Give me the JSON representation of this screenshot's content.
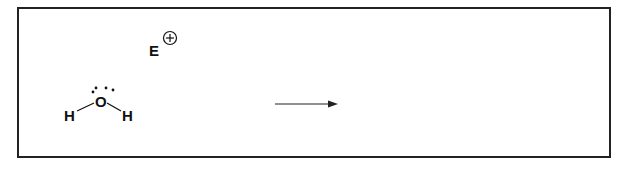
{
  "diagram": {
    "type": "reaction-scheme",
    "reactants": {
      "electrophile": {
        "symbol": "E",
        "charge": "+"
      },
      "water": {
        "central_atom": "O",
        "lone_pair_dots": 4,
        "substituents": [
          "H",
          "H"
        ]
      }
    },
    "arrow": {
      "direction": "right",
      "label": ""
    },
    "products": []
  },
  "labels": {
    "electrophile": "E",
    "oxygen": "O",
    "hydrogen_left": "H",
    "hydrogen_right": "H"
  }
}
